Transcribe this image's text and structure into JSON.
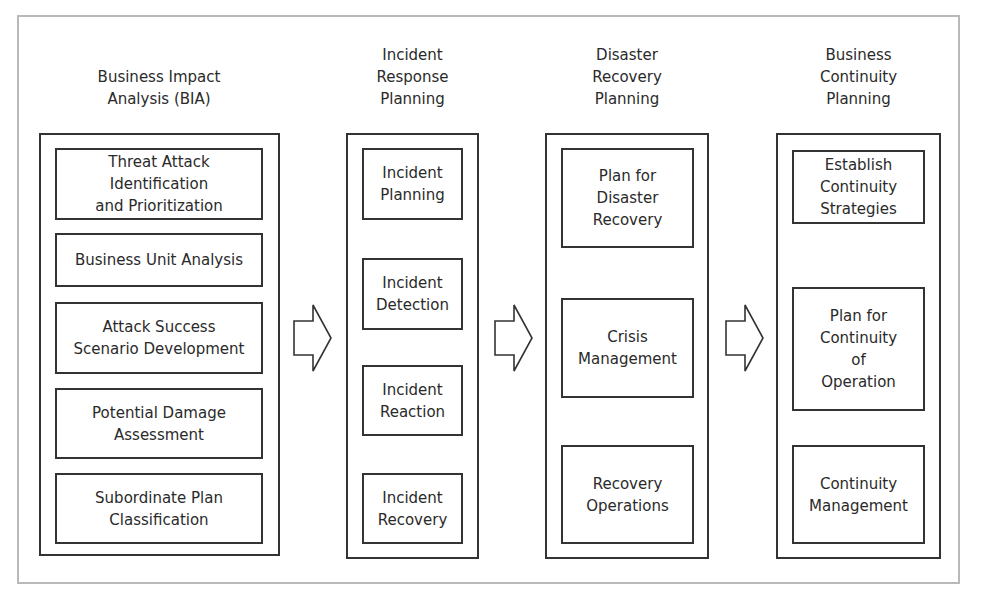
{
  "diagram": {
    "columns": [
      {
        "title": "Business Impact\nAnalysis (BIA)",
        "items": [
          "Threat Attack\nIdentification\nand Prioritization",
          "Business Unit Analysis",
          "Attack Success\nScenario Development",
          "Potential Damage\nAssessment",
          "Subordinate Plan\nClassification"
        ]
      },
      {
        "title": "Incident\nResponse\nPlanning",
        "items": [
          "Incident\nPlanning",
          "Incident\nDetection",
          "Incident\nReaction",
          "Incident\nRecovery"
        ]
      },
      {
        "title": "Disaster\nRecovery\nPlanning",
        "items": [
          "Plan for\nDisaster\nRecovery",
          "Crisis\nManagement",
          "Recovery\nOperations"
        ]
      },
      {
        "title": "Business\nContinuity\nPlanning",
        "items": [
          "Establish\nContinuity\nStrategies",
          "Plan for\nContinuity\nof\nOperation",
          "Continuity\nManagement"
        ]
      }
    ],
    "connectors": [
      {
        "from": "Business Impact Analysis (BIA)",
        "to": "Incident Response Planning",
        "icon": "right-arrow-icon"
      },
      {
        "from": "Incident Response Planning",
        "to": "Disaster Recovery Planning",
        "icon": "right-arrow-icon"
      },
      {
        "from": "Disaster Recovery Planning",
        "to": "Business Continuity Planning",
        "icon": "right-arrow-icon"
      }
    ],
    "colors": {
      "stroke": "#333333",
      "frame": "#b9b9b9",
      "text": "#2a2a2a",
      "background": "#ffffff"
    }
  }
}
